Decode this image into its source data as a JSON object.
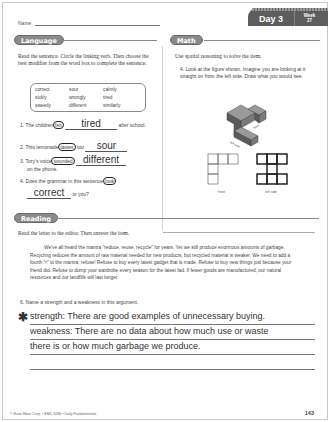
{
  "header": {
    "name_label": "Name",
    "day_label": "Day 3",
    "week_label": "Week",
    "week_number": "27"
  },
  "language": {
    "title": "Language",
    "instructions": "Read the sentence. Circle the linking verb. Then choose the best modifier from the word box to complete the sentence.",
    "word_box": [
      "correct",
      "sour",
      "calmly",
      "sickly",
      "wrongly",
      "tired",
      "sweetly",
      "different",
      "similarly"
    ],
    "items": [
      {
        "number": "1.",
        "before": "The children",
        "verb": "felt",
        "answer": "tired",
        "after": "after school."
      },
      {
        "number": "2.",
        "before": "This lemonade",
        "verb": "tastes",
        "middle": "too",
        "answer": "sour",
        "after": ""
      },
      {
        "number": "3.",
        "before": "Tory's voice",
        "verb": "sounded",
        "answer": "different",
        "after": "on the phone."
      },
      {
        "number": "4.",
        "before": "Does the grammar in this sentence",
        "verb": "look",
        "answer": "correct",
        "after": "to you?"
      }
    ]
  },
  "math": {
    "title": "Math",
    "instructions": "Use spatial reasoning to solve the item.",
    "item_number": "4.",
    "item_text": "Look at the figure shown. Imagine you are looking at it straight on from the left side. Draw what you would see.",
    "figure_labels": {
      "front": "front",
      "left_side": "left side"
    },
    "grid_labels": {
      "front": "front",
      "left_side": "left side"
    }
  },
  "reading": {
    "title": "Reading",
    "instructions": "Read the letter to the editor. Then answer the item.",
    "passage": "We've all heard the mantra \"reduce, reuse, recycle\" for years. Yet we still produce enormous amounts of garbage. Recycling reduces the amount of raw material needed for new products, but recycled material is weaker. We need to add a fourth \"r\" to the mantra: refuse! Refuse to buy every latest gadget that is made. Refuse to buy new things just because your friend did. Refuse to dump your wardrobe every season for the latest fad. If fewer goods are manufactured, our natural resources and our landfills will last longer.",
    "question_number": "6.",
    "question": "Name a strength and a weakness in this argument.",
    "answer_lines": [
      "strength: There are good examples of unnecessary buying.",
      "weakness: There are no data about how much use or waste",
      "there is or how much garbage we produce.",
      ""
    ]
  },
  "footer": {
    "copyright": "© Evan-Moor Corp. • EMC 3286 • Daily Fundamentals",
    "page_number": "143"
  }
}
